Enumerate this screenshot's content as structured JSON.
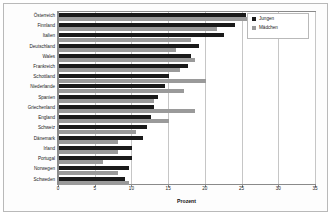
{
  "chart_data": {
    "type": "bar",
    "orientation": "horizontal",
    "title": "",
    "xlabel": "Prozent",
    "ylabel": "",
    "xlim": [
      0,
      35
    ],
    "xticks": [
      0,
      5,
      10,
      15,
      20,
      25,
      30,
      35
    ],
    "grid": true,
    "legend_position": "top-right",
    "categories": [
      "Österreich",
      "Finnland",
      "Italien",
      "Deutschland",
      "Wales",
      "Frankreich",
      "Schottland",
      "Niederlande",
      "Spanien",
      "Griechenland",
      "England",
      "Schweiz",
      "Dänemark",
      "Irland",
      "Portugal",
      "Norwegen",
      "Schweden"
    ],
    "series": [
      {
        "name": "Jungen",
        "color": "#1a1a1a",
        "values": [
          25.5,
          24.0,
          22.5,
          19.0,
          18.0,
          17.5,
          15.0,
          14.5,
          13.5,
          13.0,
          12.5,
          12.0,
          11.5,
          10.0,
          10.0,
          9.5,
          9.0
        ]
      },
      {
        "name": "Mädchen",
        "color": "#9a9a9a",
        "values": [
          30.0,
          21.5,
          18.0,
          16.0,
          18.5,
          16.5,
          20.0,
          17.0,
          13.0,
          18.5,
          15.0,
          10.5,
          8.0,
          8.0,
          6.0,
          8.0,
          9.5
        ]
      }
    ]
  },
  "legend": {
    "items": [
      {
        "label": "Jungen"
      },
      {
        "label": "Mädchen"
      }
    ]
  },
  "axis": {
    "x_title": "Prozent"
  }
}
